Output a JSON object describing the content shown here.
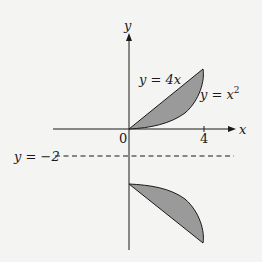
{
  "diagram": {
    "axes": {
      "x_label": "x",
      "y_label": "y",
      "origin_label": "0",
      "x_tick_label": "4"
    },
    "curves": {
      "line_label": "y = 4x",
      "parabola_label_base": "y = x",
      "parabola_exponent": "2"
    },
    "axis_of_reflection": {
      "label": "y = −2",
      "style": "dashed"
    },
    "regions": [
      {
        "name": "original-region",
        "bounded_by": [
          "y = 4x",
          "y = x^2"
        ],
        "x_range": [
          0,
          4
        ]
      },
      {
        "name": "reflected-region",
        "reflected_about": "y = -2"
      }
    ],
    "colors": {
      "background": "#f4f4f2",
      "region_fill": "#9a9a9a",
      "stroke": "#1a1a1a"
    }
  }
}
